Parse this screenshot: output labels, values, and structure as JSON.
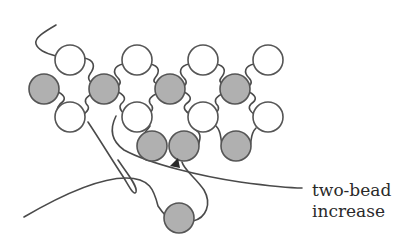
{
  "diagram": {
    "label": {
      "line1": "two-bead",
      "line2": "increase"
    },
    "colors": {
      "white_bead": "#ffffff",
      "gray_bead": "#b0b0b0",
      "stroke": "#555555",
      "thread": "#4a4a4a"
    },
    "beads": [
      {
        "row": "top",
        "color": "white",
        "x": 70,
        "y": 60
      },
      {
        "row": "top",
        "color": "white",
        "x": 137,
        "y": 60
      },
      {
        "row": "top",
        "color": "white",
        "x": 203,
        "y": 60
      },
      {
        "row": "top",
        "color": "white",
        "x": 268,
        "y": 60
      },
      {
        "row": "middle",
        "color": "gray",
        "x": 44,
        "y": 89
      },
      {
        "row": "middle",
        "color": "gray",
        "x": 104,
        "y": 89
      },
      {
        "row": "middle",
        "color": "gray",
        "x": 170,
        "y": 89
      },
      {
        "row": "middle",
        "color": "gray",
        "x": 235,
        "y": 89
      },
      {
        "row": "lower",
        "color": "white",
        "x": 70,
        "y": 117
      },
      {
        "row": "lower",
        "color": "white",
        "x": 137,
        "y": 117
      },
      {
        "row": "lower",
        "color": "white",
        "x": 203,
        "y": 117
      },
      {
        "row": "lower",
        "color": "white",
        "x": 268,
        "y": 117
      },
      {
        "row": "bottom",
        "color": "gray",
        "x": 152,
        "y": 146
      },
      {
        "row": "bottom",
        "color": "gray",
        "x": 184,
        "y": 146
      },
      {
        "row": "bottom",
        "color": "gray",
        "x": 236,
        "y": 146
      },
      {
        "row": "loose",
        "color": "gray",
        "x": 179,
        "y": 218
      }
    ]
  }
}
